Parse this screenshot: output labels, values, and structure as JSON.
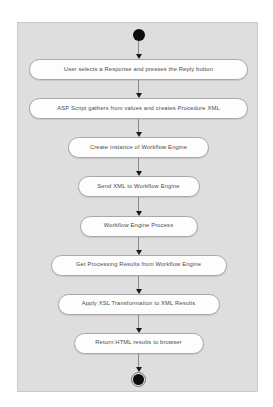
{
  "diagram": {
    "type": "uml-activity-diagram",
    "panel_background": "#dedede",
    "panel_border": "#c9c9c9",
    "node_fill": "#fdfdfd",
    "node_border": "#a8a8a8",
    "text_color": "#4b4b4b",
    "connector_color": "#8a8a8a",
    "terminal_color": "#0d0d0d",
    "start_node": {
      "name": "initial-node",
      "shape": "filled-circle"
    },
    "end_node": {
      "name": "final-node",
      "shape": "filled-circle-in-ring"
    },
    "activities": [
      {
        "id": 1,
        "label": "User selects a Response and presses the Reply button"
      },
      {
        "id": 2,
        "label": "ASP Script gathers from values and creates Procedure XML"
      },
      {
        "id": 3,
        "label": "Create instance of Workflow Engine"
      },
      {
        "id": 4,
        "label": "Send XML to Workflow Engine"
      },
      {
        "id": 5,
        "label": "Workflow Engine Process"
      },
      {
        "id": 6,
        "label": "Get Processing Results from Workflow Engine"
      },
      {
        "id": 7,
        "label": "Apply XSL Transformation to XML Results"
      },
      {
        "id": 8,
        "label": "Return HTML results to browser"
      }
    ]
  }
}
